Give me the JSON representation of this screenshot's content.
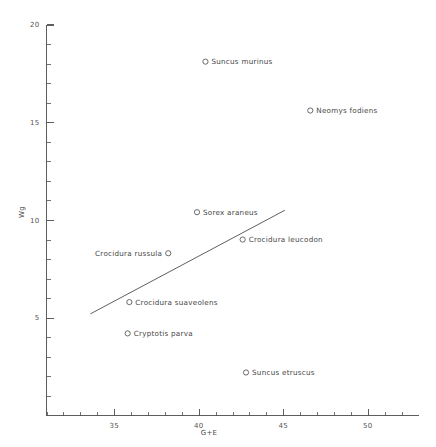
{
  "chart_data": {
    "type": "scatter",
    "title": "",
    "subtitle": "",
    "xlabel": "G+E",
    "ylabel": "Wg",
    "xlim": [
      31,
      53
    ],
    "ylim": [
      0,
      20
    ],
    "grid": false,
    "legend": "none",
    "x_ticks": [
      35,
      40,
      45,
      50
    ],
    "x_tick_labels": [
      "35",
      "40",
      "45",
      "50"
    ],
    "y_ticks": [
      5,
      10,
      15,
      20
    ],
    "y_tick_labels": [
      "5",
      "10",
      "15",
      "20"
    ],
    "x_minor_step": 1,
    "y_minor_step": 1,
    "marker_style": "open-circle",
    "points": [
      {
        "label": "Suncus murinus",
        "x": 40.4,
        "y": 18.1,
        "label_side": "right"
      },
      {
        "label": "Neomys fodiens",
        "x": 46.6,
        "y": 15.6,
        "label_side": "right"
      },
      {
        "label": "Sorex araneus",
        "x": 39.9,
        "y": 10.4,
        "label_side": "right"
      },
      {
        "label": "Crocidura leucodon",
        "x": 42.6,
        "y": 9.0,
        "label_side": "right"
      },
      {
        "label": "Crocidura russula",
        "x": 38.2,
        "y": 8.3,
        "label_side": "left"
      },
      {
        "label": "Crocidura suaveolens",
        "x": 35.9,
        "y": 5.8,
        "label_side": "right"
      },
      {
        "label": "Cryptotis parva",
        "x": 35.8,
        "y": 4.2,
        "label_side": "right"
      },
      {
        "label": "Suncus etruscus",
        "x": 42.8,
        "y": 2.2,
        "label_side": "right"
      }
    ],
    "fit_line": {
      "type": "linear-regression",
      "x_start": 33.6,
      "y_start": 5.2,
      "x_end": 45.1,
      "y_end": 10.5
    },
    "colors": {
      "axis": "#4d4d4d",
      "marker_stroke": "#5a5a5a",
      "text": "#464646",
      "fit_line": "#4d4d4d",
      "background": "#ffffff"
    }
  }
}
